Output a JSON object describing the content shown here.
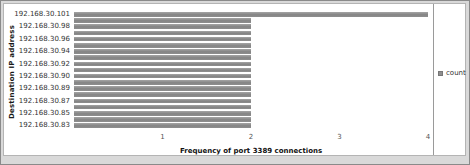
{
  "chart_data": {
    "type": "bar",
    "orientation": "horizontal",
    "xlabel": "Frequency of port 3389 connections",
    "ylabel": "Destination IP address",
    "xlim": [
      0,
      4
    ],
    "x_ticks": [
      1,
      2,
      3,
      4
    ],
    "grid": false,
    "legend_position": "right",
    "series_name": "count",
    "label_pattern": "category labels shown on alternating bars",
    "bars": [
      {
        "label": "192.168.30.101",
        "value": 4
      },
      {
        "label": "",
        "value": 2
      },
      {
        "label": "192.168.30.98",
        "value": 2
      },
      {
        "label": "",
        "value": 2
      },
      {
        "label": "192.168.30.96",
        "value": 2
      },
      {
        "label": "",
        "value": 2
      },
      {
        "label": "192.168.30.94",
        "value": 2
      },
      {
        "label": "",
        "value": 2
      },
      {
        "label": "192.168.30.92",
        "value": 2
      },
      {
        "label": "",
        "value": 2
      },
      {
        "label": "192.168.30.90",
        "value": 2
      },
      {
        "label": "",
        "value": 2
      },
      {
        "label": "192.168.30.89",
        "value": 2
      },
      {
        "label": "",
        "value": 2
      },
      {
        "label": "192.168.30.87",
        "value": 2
      },
      {
        "label": "",
        "value": 2
      },
      {
        "label": "192.168.30.85",
        "value": 2
      },
      {
        "label": "",
        "value": 2
      },
      {
        "label": "192.168.30.83",
        "value": 2
      }
    ],
    "colors": {
      "bar": "#8f8f8f",
      "bar_highlight": "#a5a5a5",
      "bar_shadow": "#848484",
      "axis_text": "#555555",
      "category_text": "#333333",
      "background": "#ffffff"
    }
  }
}
